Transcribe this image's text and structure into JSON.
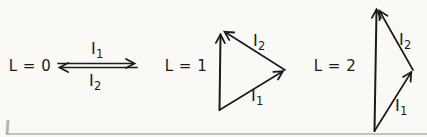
{
  "figure": {
    "background_color": "#faf9f6",
    "line_color": "#1b1b1b",
    "rule_color": "#b2b0aa",
    "groups": [
      {
        "label": "L = 0",
        "vectors": [
          {
            "base": "I",
            "sub": "1",
            "direction": "right"
          },
          {
            "base": "I",
            "sub": "2",
            "direction": "left"
          }
        ]
      },
      {
        "label": "L = 1",
        "vectors": [
          {
            "base": "I",
            "sub": "1",
            "direction": "up-right"
          },
          {
            "base": "I",
            "sub": "2",
            "direction": "up-left"
          }
        ]
      },
      {
        "label": "L = 2",
        "vectors": [
          {
            "base": "I",
            "sub": "1",
            "direction": "up-right"
          },
          {
            "base": "I",
            "sub": "2",
            "direction": "up-left"
          }
        ]
      }
    ]
  }
}
